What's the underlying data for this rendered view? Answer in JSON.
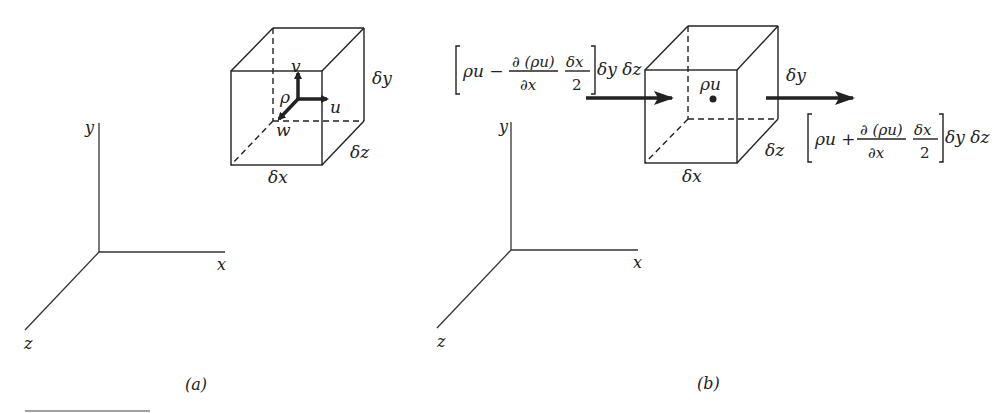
{
  "figure_a": {
    "caption": "(a)",
    "axes": {
      "x": "x",
      "y": "y",
      "z": "z"
    },
    "cube": {
      "dims": {
        "dx": "δx",
        "dy": "δy",
        "dz": "δz"
      },
      "density": "ρ",
      "velocity": {
        "u": "u",
        "v": "v",
        "w": "w"
      }
    }
  },
  "figure_b": {
    "caption": "(b)",
    "axes": {
      "x": "x",
      "y": "y",
      "z": "z"
    },
    "cube": {
      "dims": {
        "dx": "δx",
        "dy": "δy",
        "dz": "δz"
      },
      "center_label": "ρu"
    },
    "inflow": {
      "bracket_left": "[",
      "term": "ρu −",
      "numerator": "∂ (ρu)",
      "denominator": "∂x",
      "half_num": "δx",
      "half_den": "2",
      "bracket_right": "]",
      "tail": "δy δz"
    },
    "outflow": {
      "bracket_left": "[",
      "term": "ρu +",
      "numerator": "∂ (ρu)",
      "denominator": "∂x",
      "half_num": "δx",
      "half_den": "2",
      "bracket_right": "]",
      "tail": "δy δz"
    }
  }
}
